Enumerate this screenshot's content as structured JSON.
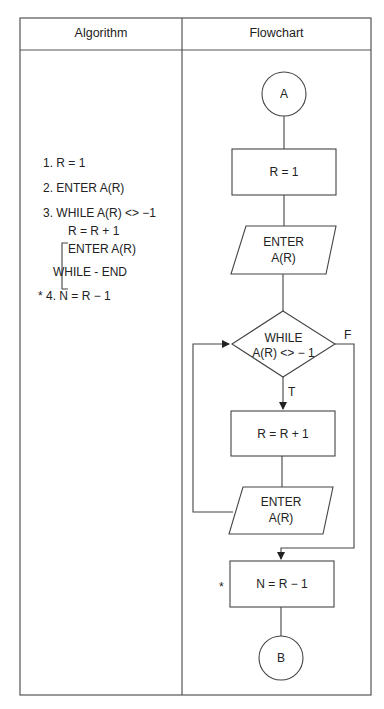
{
  "table": {
    "headers": [
      "Algorithm",
      "Flowchart"
    ]
  },
  "algorithm": {
    "steps": [
      "1. R = 1",
      "2. ENTER A(R)",
      "3. WHILE A(R) <> −1",
      "R = R + 1",
      "ENTER A(R)",
      "WHILE - END",
      "* 4. N = R − 1"
    ]
  },
  "flowchart": {
    "start_connector": "A",
    "process_1": "R = 1",
    "input_1_line1": "ENTER",
    "input_1_line2": "A(R)",
    "decision_line1": "WHILE",
    "decision_line2": "A(R) <> − 1",
    "true_label": "T",
    "false_label": "F",
    "process_2": "R = R + 1",
    "input_2_line1": "ENTER",
    "input_2_line2": "A(R)",
    "process_3": "N = R − 1",
    "process_3_marker": "*",
    "end_connector": "B"
  }
}
